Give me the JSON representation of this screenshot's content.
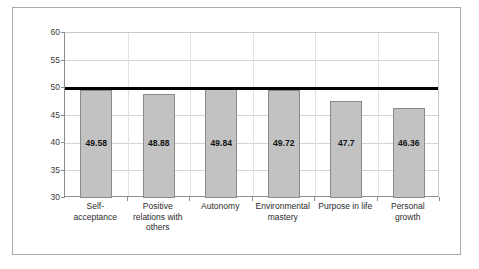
{
  "chart_data": {
    "type": "bar",
    "title": "",
    "subtitle": "",
    "xlabel": "",
    "ylabel": "",
    "ylim": [
      30,
      60
    ],
    "ytick_step": 5,
    "yticks": [
      30,
      35,
      40,
      45,
      50,
      55,
      60
    ],
    "ytick_labels": [
      "30",
      "35",
      "40",
      "45",
      "50",
      "55",
      "60"
    ],
    "grid": true,
    "legend": false,
    "legend_position": "none",
    "categories": [
      "Self-acceptance",
      "Positive relations with others",
      "Autonomy",
      "Environmental mastery",
      "Purpose in life",
      "Personal growth"
    ],
    "category_label_lines": [
      [
        "Self-",
        "acceptance"
      ],
      [
        "Positive",
        "relations with",
        "others"
      ],
      [
        "Autonomy"
      ],
      [
        "Environmental",
        "mastery"
      ],
      [
        "Purpose in life"
      ],
      [
        "Personal",
        "growth"
      ]
    ],
    "values": [
      49.58,
      48.88,
      49.84,
      49.72,
      47.7,
      46.36
    ],
    "value_labels": [
      "49.58",
      "48.88",
      "49.84",
      "49.72",
      "47.7",
      "46.36"
    ],
    "annotations": [
      {
        "name": "reference-line",
        "type": "horizontal-line",
        "value": 50,
        "color": "#000000",
        "thickness": 3
      }
    ],
    "colors": {
      "bar_fill": "#c2c2c2",
      "bar_border": "#8a8a8a",
      "gridline": "#d4d4d4",
      "axis": "#8d8d8d",
      "frame": "#aaaaaa",
      "reference_line": "#000000",
      "text": "#2b2b2b",
      "plot_background": "#ffffff"
    }
  }
}
